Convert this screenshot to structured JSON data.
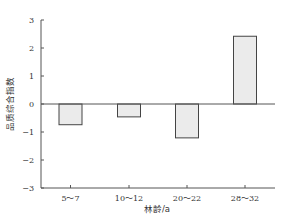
{
  "chart_data": {
    "type": "bar",
    "title": "",
    "xlabel": "林龄/a",
    "ylabel": "品质综合指数",
    "categories": [
      "5～7",
      "10～12",
      "20～22",
      "28～32"
    ],
    "values": [
      -0.74,
      -0.46,
      -1.21,
      2.42
    ],
    "ylim": [
      -3,
      3
    ],
    "yticks": [
      3,
      2,
      1,
      0,
      -1,
      -2,
      -3
    ],
    "grid": false,
    "legend": null,
    "zero_line": true,
    "colors": {
      "bar_fill": "#ebebeb",
      "bar_stroke": "#444444",
      "axis": "#555555"
    }
  }
}
